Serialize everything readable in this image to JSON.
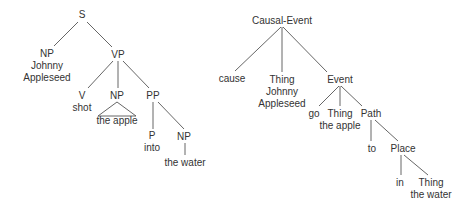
{
  "diagrams": [
    {
      "name": "syntactic-tree",
      "nodes": [
        {
          "id": "S",
          "lines": [
            "S"
          ],
          "x": 82,
          "y": 14
        },
        {
          "id": "NP1",
          "lines": [
            "NP",
            "Johnny",
            "Appleseed"
          ],
          "x": 47,
          "y": 53
        },
        {
          "id": "VP",
          "lines": [
            "VP"
          ],
          "x": 118,
          "y": 54
        },
        {
          "id": "V",
          "lines": [
            "V",
            "shot"
          ],
          "x": 82,
          "y": 95
        },
        {
          "id": "NP2",
          "lines": [
            "NP"
          ],
          "x": 117,
          "y": 95
        },
        {
          "id": "PP",
          "lines": [
            "PP"
          ],
          "x": 153,
          "y": 95
        },
        {
          "id": "P",
          "lines": [
            "P",
            "into"
          ],
          "x": 152,
          "y": 135
        },
        {
          "id": "NP3",
          "lines": [
            "NP"
          ],
          "x": 184,
          "y": 136
        },
        {
          "id": "water1",
          "lines": [
            "the water"
          ],
          "x": 185,
          "y": 162
        }
      ],
      "triangles": [
        {
          "under": "NP2",
          "apex": [
            117,
            102
          ],
          "base_y": 116,
          "x1": 98,
          "x2": 136,
          "label": "the apple",
          "label_x": 117,
          "label_y": 120
        }
      ],
      "edges": [
        {
          "from": [
            78,
            22
          ],
          "to": [
            54,
            46
          ]
        },
        {
          "from": [
            87,
            22
          ],
          "to": [
            112,
            47
          ]
        },
        {
          "from": [
            113,
            61
          ],
          "to": [
            88,
            88
          ]
        },
        {
          "from": [
            118,
            61
          ],
          "to": [
            118,
            88
          ]
        },
        {
          "from": [
            123,
            61
          ],
          "to": [
            149,
            88
          ]
        },
        {
          "from": [
            153,
            102
          ],
          "to": [
            153,
            129
          ]
        },
        {
          "from": [
            158,
            102
          ],
          "to": [
            184,
            129
          ]
        },
        {
          "from": [
            185,
            143
          ],
          "to": [
            185,
            155
          ]
        }
      ]
    },
    {
      "name": "conceptual-structure-tree",
      "nodes": [
        {
          "id": "CausalEvent",
          "lines": [
            "Causal-Event"
          ],
          "x": 282,
          "y": 20
        },
        {
          "id": "cause",
          "lines": [
            "cause"
          ],
          "x": 232,
          "y": 78
        },
        {
          "id": "Thing1",
          "lines": [
            "Thing",
            "Johnny",
            "Appleseed"
          ],
          "x": 282,
          "y": 79
        },
        {
          "id": "Event",
          "lines": [
            "Event"
          ],
          "x": 340,
          "y": 79
        },
        {
          "id": "go",
          "lines": [
            "go"
          ],
          "x": 314,
          "y": 113
        },
        {
          "id": "Thing2",
          "lines": [
            "Thing",
            "the apple"
          ],
          "x": 340,
          "y": 113
        },
        {
          "id": "Path",
          "lines": [
            "Path"
          ],
          "x": 371,
          "y": 113
        },
        {
          "id": "to",
          "lines": [
            "to"
          ],
          "x": 372,
          "y": 148
        },
        {
          "id": "Place",
          "lines": [
            "Place"
          ],
          "x": 403,
          "y": 148
        },
        {
          "id": "in",
          "lines": [
            "in"
          ],
          "x": 400,
          "y": 182
        },
        {
          "id": "Thing3",
          "lines": [
            "Thing",
            "the water"
          ],
          "x": 431,
          "y": 182
        }
      ],
      "triangles": [],
      "edges": [
        {
          "from": [
            281,
            27
          ],
          "to": [
            235,
            71
          ]
        },
        {
          "from": [
            282,
            27
          ],
          "to": [
            282,
            72
          ]
        },
        {
          "from": [
            283,
            27
          ],
          "to": [
            327,
            72
          ]
        },
        {
          "from": [
            339,
            86
          ],
          "to": [
            319,
            106
          ]
        },
        {
          "from": [
            340,
            86
          ],
          "to": [
            340,
            106
          ]
        },
        {
          "from": [
            341,
            86
          ],
          "to": [
            362,
            106
          ]
        },
        {
          "from": [
            371,
            120
          ],
          "to": [
            371,
            141
          ]
        },
        {
          "from": [
            375,
            120
          ],
          "to": [
            398,
            141
          ]
        },
        {
          "from": [
            401,
            155
          ],
          "to": [
            401,
            175
          ]
        },
        {
          "from": [
            404,
            155
          ],
          "to": [
            428,
            175
          ]
        }
      ]
    }
  ],
  "style": {
    "text_color": "#333333",
    "line_color": "#555555",
    "background": "#ffffff",
    "line_height": 12
  }
}
